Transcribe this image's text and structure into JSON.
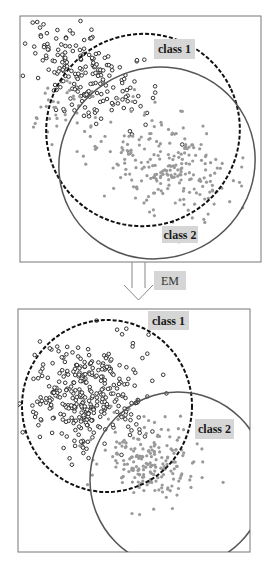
{
  "arrow_label": "EM",
  "panels": {
    "before": {
      "label_class1": "class 1",
      "label_class2": "class 2"
    },
    "after": {
      "label_class1": "class 1",
      "label_class2": "class 2"
    }
  },
  "colors": {
    "frame": "#777777",
    "class1_point": "#222222",
    "class2_point": "#999999",
    "dashed_ellipse": "#111111",
    "solid_ellipse": "#555555",
    "label_bg": "#d6d6d6"
  },
  "chart_data": {
    "type": "scatter",
    "annotations": [
      "class 1",
      "class 2",
      "EM"
    ],
    "panels": [
      {
        "name": "before",
        "box": [
          20,
          16,
          261,
          262
        ],
        "clusters": [
          {
            "name": "class 1 points (hollow black)",
            "center": [
              85,
              75
            ],
            "spread": [
              30,
              28
            ],
            "tilt": 0.5,
            "count": 200,
            "seed": 11
          },
          {
            "name": "class 2 points (gray filled)",
            "center": [
              165,
              165
            ],
            "spread": [
              32,
              25
            ],
            "tilt": 0.2,
            "count": 230,
            "seed": 23
          },
          {
            "name": "gray stragglers",
            "center": [
              60,
              110
            ],
            "spread": [
              22,
              16
            ],
            "tilt": 0,
            "count": 40,
            "seed": 31
          }
        ],
        "ellipses": [
          {
            "name": "class 1 (dashed)",
            "cx": 143,
            "cy": 130,
            "rx": 97,
            "ry": 96,
            "rot": -25,
            "dashed": true
          },
          {
            "name": "class 2 (solid)",
            "cx": 157,
            "cy": 163,
            "rx": 99,
            "ry": 95,
            "rot": -28,
            "dashed": false
          }
        ],
        "labels": [
          {
            "text": "class 1",
            "x": 154,
            "y": 39,
            "w": 41,
            "h": 20
          },
          {
            "text": "class 2",
            "x": 162,
            "y": 226,
            "w": 36,
            "h": 17
          }
        ]
      },
      {
        "name": "after",
        "box": [
          18,
          309,
          250,
          552
        ],
        "clusters": [
          {
            "name": "class 1 points (hollow black)",
            "center": [
              88,
              395
            ],
            "spread": [
              30,
              26
            ],
            "tilt": 0,
            "count": 330,
            "seed": 41
          },
          {
            "name": "class 2 points (gray filled)",
            "center": [
              150,
              460
            ],
            "spread": [
              26,
              22
            ],
            "tilt": 0.1,
            "count": 200,
            "seed": 53
          }
        ],
        "ellipses": [
          {
            "name": "class 1 (dashed)",
            "cx": 107,
            "cy": 406,
            "rx": 85,
            "ry": 86,
            "rot": 0,
            "dashed": true
          },
          {
            "name": "class 2 (solid)",
            "cx": 178,
            "cy": 480,
            "rx": 88,
            "ry": 88,
            "rot": 0,
            "dashed": false
          }
        ],
        "labels": [
          {
            "text": "class 1",
            "x": 148,
            "y": 311,
            "w": 41,
            "h": 19
          },
          {
            "text": "class 2",
            "x": 195,
            "y": 419,
            "w": 39,
            "h": 20
          }
        ]
      }
    ]
  }
}
